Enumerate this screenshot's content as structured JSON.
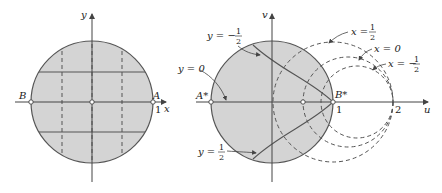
{
  "colors": {
    "disk_fill": "#d4d4d4",
    "stroke": "#555555",
    "text": "#222222",
    "background": "#ffffff"
  },
  "left_diagram": {
    "axis_x_label": "x",
    "axis_y_label": "y",
    "point_B": "B",
    "point_A": "A",
    "tick_1": "1"
  },
  "right_diagram": {
    "axis_u_label": "u",
    "axis_v_label": "v",
    "point_A_star": "A*",
    "point_B_star": "B*",
    "tick_1": "1",
    "tick_2": "2",
    "label_y0": "y = 0",
    "label_y_neg_half_prefix": "y = −",
    "label_y_pos_half_prefix": "y = ",
    "label_x_half_prefix": "x = ",
    "label_x0": "x = 0",
    "label_x_neg_half_prefix": "x = −",
    "frac_num": "1",
    "frac_den": "2"
  }
}
